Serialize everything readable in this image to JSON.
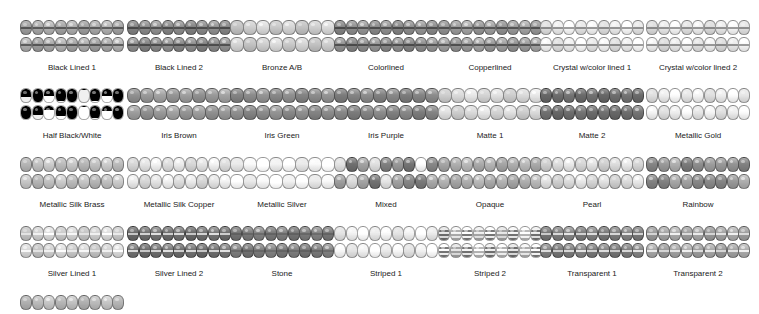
{
  "swatches": [
    {
      "label": "Black Lined 1",
      "style": "lined",
      "base": "#a9a9a9",
      "line": "dark",
      "beads": 9
    },
    {
      "label": "Black Lined 2",
      "style": "lined",
      "base": "#8a8a8a",
      "line": "dark",
      "beads": 9
    },
    {
      "label": "Bronze A/B",
      "style": "plain",
      "base": "#d0d0d0",
      "beads": 8
    },
    {
      "label": "Colorlined",
      "style": "lined",
      "base": "#8e8e8e",
      "line": "dark",
      "beads": 9
    },
    {
      "label": "Copperlined",
      "style": "lined",
      "base": "#9c9c9c",
      "line": "dark",
      "beads": 9
    },
    {
      "label": "Crystal w/color lined 1",
      "style": "lined",
      "base": "#f0f0f0",
      "line": "mid",
      "beads": 9
    },
    {
      "label": "Crystal w/color lined 2",
      "style": "lined",
      "base": "#ececec",
      "line": "mid",
      "beads": 9
    },
    {
      "label": "Half Black/White",
      "style": "half",
      "base": "#ffffff",
      "beads": 9
    },
    {
      "label": "Iris Brown",
      "style": "plain",
      "base": "#9a9a9a",
      "beads": 8
    },
    {
      "label": "Iris Green",
      "style": "plain",
      "base": "#8c8c8c",
      "beads": 8
    },
    {
      "label": "Iris Purple",
      "style": "plain",
      "base": "#858585",
      "beads": 8
    },
    {
      "label": "Matte 1",
      "style": "plain",
      "base": "#dcdcdc",
      "beads": 8
    },
    {
      "label": "Matte 2",
      "style": "plain",
      "base": "#6e6e6e",
      "beads": 9
    },
    {
      "label": "Metallic Gold",
      "style": "plain",
      "base": "#efefef",
      "beads": 9
    },
    {
      "label": "Metallic Silk Brass",
      "style": "plain",
      "base": "#c2c2c2",
      "beads": 9
    },
    {
      "label": "Metallic Silk Copper",
      "style": "plain",
      "base": "#e6e6e6",
      "beads": 9
    },
    {
      "label": "Metallic Silver",
      "style": "plain",
      "base": "#fafafa",
      "beads": 8
    },
    {
      "label": "Mixed",
      "style": "mixed",
      "base": "#a0a0a0",
      "beads": 9
    },
    {
      "label": "Opaque",
      "style": "plain",
      "base": "#b0b0b0",
      "beads": 9
    },
    {
      "label": "Pearl",
      "style": "plain",
      "base": "#dedede",
      "beads": 9
    },
    {
      "label": "Rainbow",
      "style": "mixed2",
      "base": "#8f8f8f",
      "beads": 9
    },
    {
      "label": "Silver Lined 1",
      "style": "lined",
      "base": "#d2d2d2",
      "line": "light",
      "beads": 9
    },
    {
      "label": "Silver Lined 2",
      "style": "lined",
      "base": "#6f6f6f",
      "line": "light",
      "beads": 9
    },
    {
      "label": "Stone",
      "style": "lined",
      "base": "#7c7c7c",
      "line": "mid",
      "beads": 9
    },
    {
      "label": "Striped 1",
      "style": "speck",
      "base": "#f4f4f4",
      "beads": 9
    },
    {
      "label": "Striped 2",
      "style": "striped",
      "base": "#f7f7f7",
      "beads": 9
    },
    {
      "label": "Transparent 1",
      "style": "lined",
      "base": "#7e7e7e",
      "line": "light",
      "beads": 9
    },
    {
      "label": "Transparent 2",
      "style": "lined",
      "base": "#a4a4a4",
      "line": "light",
      "beads": 9
    },
    {
      "label": "",
      "style": "plain",
      "base": "#bdbdbd",
      "beads": 9,
      "partial": true
    }
  ],
  "layout": {
    "col_x": [
      20,
      127,
      230,
      334,
      438,
      540,
      646
    ],
    "row_y": [
      20,
      88,
      157,
      226,
      295
    ]
  }
}
